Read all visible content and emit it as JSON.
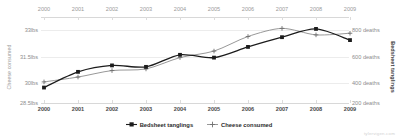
{
  "watermark": "tylervigen.com",
  "axes": {
    "left_title": "Cheese consumed",
    "right_title": "Bedsheet tanglings",
    "left_ticks": [
      "33lbs",
      "31.5lbs",
      "30lbs",
      "28.5lbs"
    ],
    "right_ticks": [
      "800 deaths",
      "600 deaths",
      "400 deaths",
      "200 deaths"
    ],
    "x_ticks_top": [
      "2000",
      "2001",
      "2002",
      "2003",
      "2004",
      "2005",
      "2006",
      "2007",
      "2008",
      "2009"
    ],
    "x_ticks_bottom": [
      "2000",
      "2001",
      "2002",
      "2003",
      "2004",
      "2005",
      "2006",
      "2007",
      "2008",
      "2009"
    ]
  },
  "legend": {
    "items": [
      {
        "label": "Bedsheet tanglings",
        "marker": "filled-square-marker",
        "color": "#1c1c1c"
      },
      {
        "label": "Cheese consumed",
        "marker": "plus-marker",
        "color": "#8c8c8c"
      }
    ]
  },
  "chart_data": {
    "type": "line",
    "title": "",
    "xlabel": "",
    "grid": true,
    "legend_position": "bottom-center",
    "x": [
      2000,
      2001,
      2002,
      2003,
      2004,
      2005,
      2006,
      2007,
      2008,
      2009
    ],
    "series": [
      {
        "name": "Bedsheet tanglings",
        "ylabel": "Bedsheet tanglings",
        "unit": "deaths",
        "axis": "right",
        "ylim": [
          200,
          800
        ],
        "yticks": [
          200,
          400,
          600,
          800
        ],
        "color": "#1c1c1c",
        "marker": "square",
        "values": [
          327,
          456,
          509,
          497,
          596,
          573,
          661,
          741,
          809,
          717
        ]
      },
      {
        "name": "Cheese consumed",
        "ylabel": "Cheese consumed",
        "unit": "lbs",
        "axis": "left",
        "ylim": [
          28.5,
          33
        ],
        "yticks": [
          28.5,
          30,
          31.5,
          33
        ],
        "color": "#8c8c8c",
        "marker": "plus",
        "values": [
          29.8,
          30.1,
          30.5,
          30.6,
          31.3,
          31.7,
          32.6,
          33.1,
          32.7,
          32.8
        ]
      }
    ]
  }
}
